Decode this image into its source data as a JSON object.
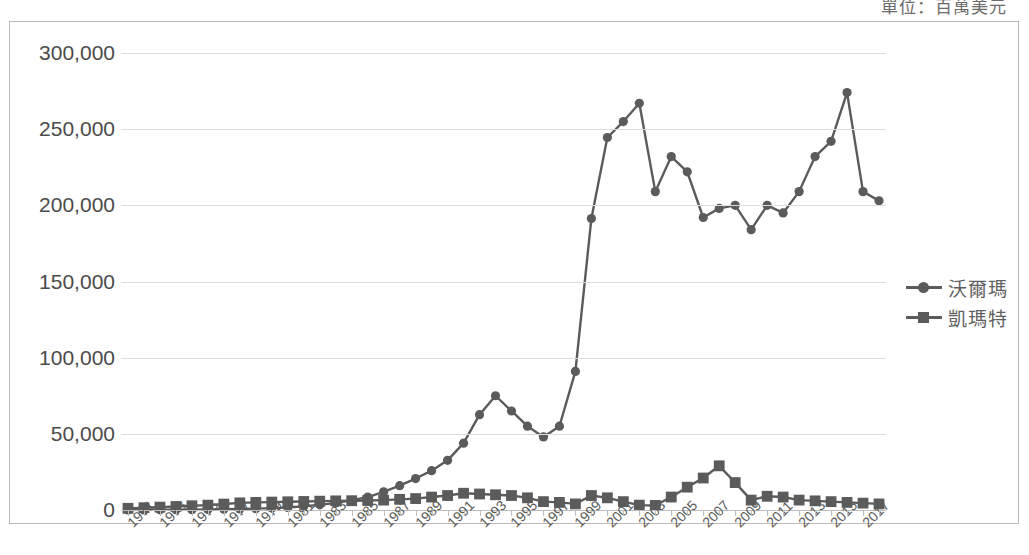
{
  "caption": {
    "unit_text": "單位：百萬美元"
  },
  "legend": {
    "position": "right",
    "items": [
      {
        "label": "沃爾瑪",
        "marker": "circle",
        "color": "#5b5b5b"
      },
      {
        "label": "凱瑪特",
        "marker": "square",
        "color": "#5b5b5b"
      }
    ]
  },
  "chart_data": {
    "type": "line",
    "title": "",
    "subtitle": "",
    "xlabel": "",
    "ylabel": "",
    "unit": "單位：百萬美元",
    "grid": true,
    "legend_position": "right",
    "ylim": [
      0,
      300000
    ],
    "yticks": [
      0,
      50000,
      100000,
      150000,
      200000,
      250000,
      300000
    ],
    "ytick_labels": [
      "0",
      "50,000",
      "100,000",
      "150,000",
      "200,000",
      "250,000",
      "300,000"
    ],
    "x": [
      1971,
      1972,
      1973,
      1974,
      1975,
      1976,
      1977,
      1978,
      1979,
      1980,
      1981,
      1982,
      1983,
      1984,
      1985,
      1986,
      1987,
      1988,
      1989,
      1990,
      1991,
      1992,
      1993,
      1994,
      1995,
      1996,
      1997,
      1998,
      1999,
      2000,
      2001,
      2002,
      2003,
      2004,
      2005,
      2006,
      2007,
      2008,
      2009,
      2010,
      2011,
      2012,
      2013,
      2014,
      2015,
      2016,
      2017,
      2018
    ],
    "xtick_labels": [
      "1971",
      "1973",
      "1975",
      "1977",
      "1979",
      "1981",
      "1983",
      "1985",
      "1987",
      "1989",
      "1991",
      "1993",
      "1995",
      "1997",
      "1999",
      "2001",
      "2003",
      "2005",
      "2007",
      "2009",
      "2011",
      "2013",
      "2015",
      "2017"
    ],
    "xtick_step": 2,
    "series": [
      {
        "name": "沃爾瑪",
        "marker": "circle",
        "color": "#5b5b5b",
        "values": [
          44,
          78,
          125,
          168,
          236,
          340,
          479,
          678,
          900,
          1248,
          1643,
          2445,
          3376,
          4667,
          6401,
          8451,
          11909,
          15959,
          20649,
          25811,
          32602,
          43887,
          62560,
          75000,
          65000,
          55000,
          48000,
          55000,
          91000,
          191329,
          244524,
          255000,
          267000,
          209000,
          232000,
          222000,
          192000,
          198000,
          200000,
          184000,
          200000,
          195000,
          209000,
          232000,
          242000,
          274000,
          209000,
          203000
        ]
      },
      {
        "name": "凱瑪特",
        "marker": "square",
        "color": "#5b5b5b",
        "values": [
          1100,
          1500,
          1900,
          2300,
          2800,
          3200,
          3900,
          4700,
          5000,
          5200,
          5400,
          5600,
          5800,
          6000,
          6100,
          6200,
          6500,
          7000,
          7500,
          8500,
          9500,
          11000,
          10500,
          10000,
          9500,
          8000,
          5500,
          5000,
          4000,
          9500,
          8000,
          5500,
          3200,
          3000,
          8500,
          15000,
          21000,
          29000,
          18000,
          6500,
          9000,
          8500,
          6500,
          6000,
          5500,
          5000,
          4500,
          4000
        ]
      }
    ]
  }
}
